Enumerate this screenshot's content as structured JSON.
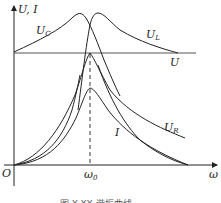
{
  "figure": {
    "type": "resonance-curves",
    "axes": {
      "y_label": "U, I",
      "x_label": "ω",
      "origin_label": "O",
      "x_marker": "ω",
      "x_marker_sub": "0"
    },
    "curves": [
      {
        "id": "Uc",
        "label": "U",
        "sub": "C"
      },
      {
        "id": "UL",
        "label": "U",
        "sub": "L"
      },
      {
        "id": "U",
        "label": "U",
        "sub": ""
      },
      {
        "id": "UR",
        "label": "U",
        "sub": "R"
      },
      {
        "id": "I",
        "label": "I",
        "sub": ""
      }
    ],
    "caption": "图 X-XX  谐振曲线"
  },
  "colors": {
    "stroke": "#222222",
    "background": "#ffffff"
  }
}
